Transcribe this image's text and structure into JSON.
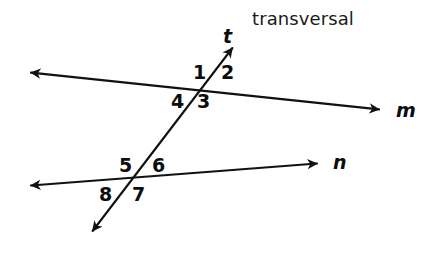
{
  "figure": {
    "background_color": "#ffffff",
    "stroke_color": "#111111",
    "caption": {
      "text": "transversal",
      "x": 252,
      "y": 10
    },
    "lines": [
      {
        "name": "m",
        "label": "m",
        "label_x": 396,
        "label_y": 101,
        "from": {
          "x": 25,
          "y": 72
        },
        "to": {
          "x": 385,
          "y": 110
        },
        "arrow_start": true,
        "arrow_end": true
      },
      {
        "name": "n",
        "label": "n",
        "label_x": 333,
        "label_y": 153,
        "from": {
          "x": 25,
          "y": 186
        },
        "to": {
          "x": 323,
          "y": 163
        },
        "arrow_start": true,
        "arrow_end": true
      },
      {
        "name": "t",
        "label": "t",
        "label_x": 223,
        "label_y": 27,
        "from": {
          "x": 88,
          "y": 237
        },
        "to": {
          "x": 237,
          "y": 42
        },
        "arrow_start": true,
        "arrow_end": true
      }
    ],
    "intersections": [
      {
        "name": "m-and-t",
        "x": 203,
        "y": 88
      },
      {
        "name": "n-and-t",
        "x": 135,
        "y": 180
      }
    ],
    "angle_labels": [
      {
        "id": "angle-1",
        "text": "1",
        "x": 193,
        "y": 63,
        "at": "m-and-t",
        "position": "upper-left"
      },
      {
        "id": "angle-2",
        "text": "2",
        "x": 221,
        "y": 63,
        "at": "m-and-t",
        "position": "upper-right"
      },
      {
        "id": "angle-3",
        "text": "3",
        "x": 197,
        "y": 92,
        "at": "m-and-t",
        "position": "lower-right"
      },
      {
        "id": "angle-4",
        "text": "4",
        "x": 171,
        "y": 92,
        "at": "m-and-t",
        "position": "lower-left"
      },
      {
        "id": "angle-5",
        "text": "5",
        "x": 119,
        "y": 156,
        "at": "n-and-t",
        "position": "upper-left"
      },
      {
        "id": "angle-6",
        "text": "6",
        "x": 152,
        "y": 156,
        "at": "n-and-t",
        "position": "upper-right"
      },
      {
        "id": "angle-7",
        "text": "7",
        "x": 132,
        "y": 185,
        "at": "n-and-t",
        "position": "lower-right"
      },
      {
        "id": "angle-8",
        "text": "8",
        "x": 99,
        "y": 185,
        "at": "n-and-t",
        "position": "lower-left"
      }
    ]
  }
}
